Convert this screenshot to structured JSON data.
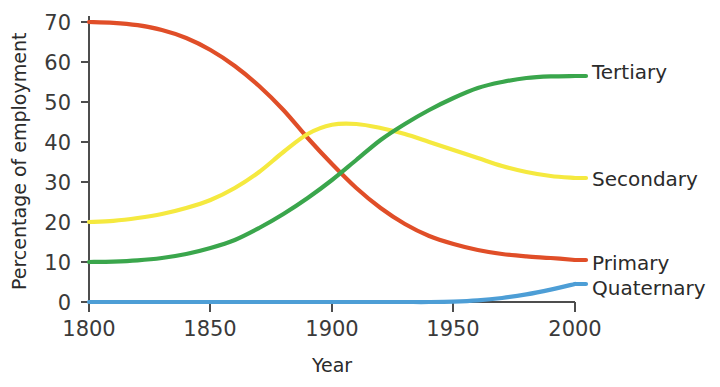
{
  "chart_data": {
    "type": "line",
    "title": "",
    "xlabel": "Year",
    "ylabel": "Percentage of employment",
    "xlim": [
      1800,
      2000
    ],
    "ylim": [
      0,
      70
    ],
    "xticks": [
      1800,
      1850,
      1900,
      1950,
      2000
    ],
    "xtick_labels": [
      "1800",
      "1850",
      "1900",
      "1950",
      "2000"
    ],
    "yticks": [
      0,
      10,
      20,
      30,
      40,
      50,
      60,
      70
    ],
    "ytick_labels": [
      "0",
      "10",
      "20",
      "30",
      "40",
      "50",
      "60",
      "70"
    ],
    "grid": false,
    "legend_position": "right-inline-labels",
    "x": [
      1800,
      1810,
      1820,
      1830,
      1840,
      1850,
      1860,
      1870,
      1880,
      1890,
      1900,
      1910,
      1920,
      1930,
      1940,
      1950,
      1960,
      1970,
      1980,
      1990,
      2000
    ],
    "series": [
      {
        "name": "Primary",
        "color": "#e04e28",
        "label": "Primary",
        "values": [
          70,
          69.8,
          69.2,
          68,
          66,
          63,
          59,
          54,
          48,
          41,
          34.5,
          28.5,
          23.5,
          19.5,
          16.5,
          14.5,
          13,
          12,
          11.4,
          11,
          10.5
        ]
      },
      {
        "name": "Secondary",
        "color": "#f5e93f",
        "label": "Secondary",
        "values": [
          20,
          20.3,
          21,
          22,
          23.5,
          25.5,
          28.5,
          32.5,
          37.5,
          42,
          44.3,
          44.5,
          43.5,
          42,
          40,
          38,
          36,
          34,
          32.5,
          31.5,
          31
        ]
      },
      {
        "name": "Tertiary",
        "color": "#3aa64c",
        "label": "Tertiary",
        "values": [
          10,
          10.1,
          10.4,
          11,
          12,
          13.5,
          15.5,
          18.5,
          22,
          26,
          30.5,
          35.5,
          40.5,
          44.5,
          48,
          51,
          53.5,
          55,
          56,
          56.4,
          56.5
        ]
      },
      {
        "name": "Quaternary",
        "color": "#4d9ed6",
        "label": "Quaternary",
        "values": [
          0,
          0,
          0,
          0,
          0,
          0,
          0,
          0,
          0,
          0,
          0,
          0,
          0,
          0,
          0,
          0.1,
          0.4,
          1.0,
          1.9,
          3.1,
          4.5
        ]
      }
    ],
    "annotations": [
      {
        "name": "primary-green-crossover",
        "text": "",
        "x": 1900,
        "y": 28
      },
      {
        "name": "secondary-peak",
        "text": "",
        "x": 1908,
        "y": 44.5
      }
    ]
  }
}
